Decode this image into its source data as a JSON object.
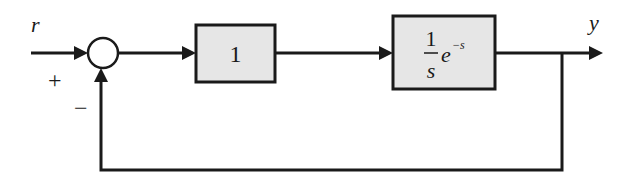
{
  "diagram": {
    "type": "feedback-control-block-diagram",
    "input_label": "r",
    "output_label": "y",
    "summing_junction": {
      "plus_sign": "+",
      "minus_sign": "−"
    },
    "blocks": [
      {
        "id": "controller",
        "expression": "1"
      },
      {
        "id": "plant",
        "expression": "(1/s) e^(-s)",
        "numerator": "1",
        "denominator": "s",
        "exp_base": "e",
        "exp_power": "−s"
      }
    ],
    "feedback": "unity negative feedback from y to summing junction",
    "colors": {
      "line": "#1a1a1a",
      "block_fill": "#e6e6e6",
      "background": "#ffffff"
    }
  }
}
